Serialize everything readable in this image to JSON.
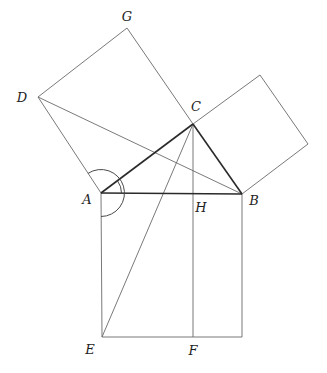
{
  "diagram": {
    "points": {
      "A": [
        101,
        193
      ],
      "B": [
        242,
        194
      ],
      "C": [
        193,
        124
      ],
      "D": [
        38,
        97
      ],
      "G": [
        127,
        28
      ],
      "E": [
        102,
        337
      ],
      "F": [
        193,
        337
      ],
      "H": [
        193,
        194
      ],
      "BR": [
        242,
        337
      ],
      "K": [
        260,
        75
      ],
      "L": [
        308,
        144
      ]
    },
    "labels": [
      {
        "id": "A",
        "text": "A",
        "x": 87,
        "y": 199
      },
      {
        "id": "B",
        "text": "B",
        "x": 254,
        "y": 200
      },
      {
        "id": "C",
        "text": "C",
        "x": 196,
        "y": 106
      },
      {
        "id": "D",
        "text": "D",
        "x": 22,
        "y": 97
      },
      {
        "id": "G",
        "text": "G",
        "x": 127,
        "y": 16
      },
      {
        "id": "H",
        "text": "H",
        "x": 201,
        "y": 207
      },
      {
        "id": "E",
        "text": "E",
        "x": 90,
        "y": 349
      },
      {
        "id": "F",
        "text": "F",
        "x": 193,
        "y": 350
      }
    ],
    "segments_bold": [
      [
        "A",
        "C"
      ],
      [
        "C",
        "B"
      ],
      [
        "A",
        "B"
      ]
    ],
    "segments_thin": [
      [
        "A",
        "D"
      ],
      [
        "D",
        "G"
      ],
      [
        "G",
        "C"
      ],
      [
        "C",
        "K"
      ],
      [
        "K",
        "L"
      ],
      [
        "L",
        "B"
      ],
      [
        "A",
        "E"
      ],
      [
        "E",
        "BR"
      ],
      [
        "BR",
        "B"
      ],
      [
        "D",
        "B"
      ],
      [
        "C",
        "E"
      ],
      [
        "C",
        "F"
      ]
    ],
    "colors": {
      "background": "#ffffff",
      "line": "#6a6a6a",
      "bold_line": "#2a2a2a",
      "text": "#1e1e1e"
    }
  }
}
